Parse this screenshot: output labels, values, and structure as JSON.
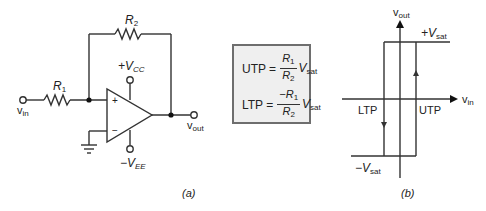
{
  "figure_a": {
    "caption": "(a)",
    "components": {
      "r1": {
        "label": "R",
        "sub": "1"
      },
      "r2": {
        "label": "R",
        "sub": "2"
      },
      "vcc": {
        "label": "+V",
        "sub": "CC"
      },
      "vee": {
        "label": "−V",
        "sub": "EE"
      },
      "vin": {
        "label": "v",
        "sub": "in"
      },
      "vout": {
        "label": "v",
        "sub": "out"
      },
      "plus_input": "+",
      "minus_input": "−"
    }
  },
  "equations": {
    "utp": {
      "lhs": "UTP =",
      "num": "R",
      "num_sub": "1",
      "den": "R",
      "den_sub": "2",
      "tail": "V",
      "tail_sub": "sat"
    },
    "ltp": {
      "lhs": "LTP =",
      "num": "−R",
      "num_sub": "1",
      "den": "R",
      "den_sub": "2",
      "tail": "V",
      "tail_sub": "sat"
    }
  },
  "figure_b": {
    "caption": "(b)",
    "y_axis": {
      "label": "v",
      "sub": "out"
    },
    "x_axis": {
      "label": "v",
      "sub": "in"
    },
    "pos_sat": {
      "label": "+V",
      "sub": "sat"
    },
    "neg_sat": {
      "label": "−V",
      "sub": "sat"
    },
    "ltp_label": "LTP",
    "utp_label": "UTP"
  }
}
